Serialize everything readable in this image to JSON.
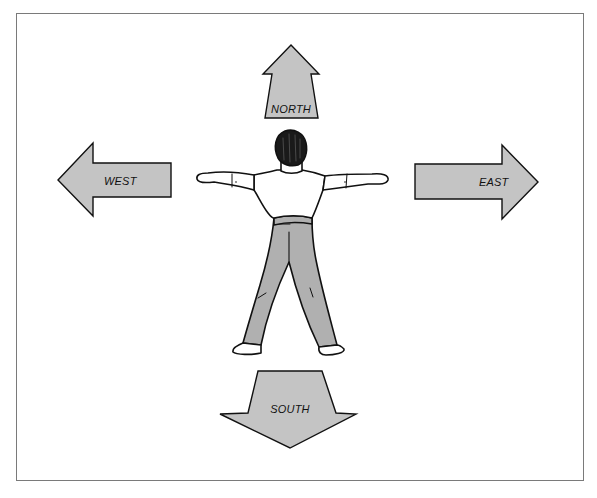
{
  "diagram": {
    "colors": {
      "arrow_fill": "#c4c4c4",
      "pants_fill": "#b0b0b0",
      "outline": "#111111",
      "frame": "#7a7a7a",
      "background": "#ffffff"
    },
    "arrows": {
      "north": {
        "label": "NORTH",
        "direction": "up"
      },
      "south": {
        "label": "SOUTH",
        "direction": "down"
      },
      "west": {
        "label": "WEST",
        "direction": "left"
      },
      "east": {
        "label": "EAST",
        "direction": "right"
      }
    },
    "figure": {
      "icon": "person-back-view-icon",
      "pose": "arms-outstretched"
    }
  }
}
